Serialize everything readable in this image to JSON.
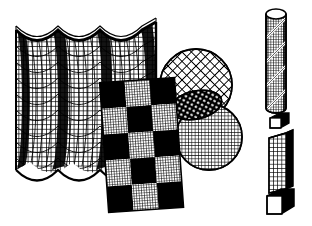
{
  "figure": {
    "background_color": "#ffffff",
    "ink_color": "#000000",
    "width": 312,
    "height": 226,
    "style": "black-and-white line art, halftone mesh textures"
  },
  "objects": [
    {
      "id": "wavy-curtain",
      "label": "Wavy curtain surface with square grid texture",
      "texture": "orthogonal-grid",
      "folds": 3,
      "bounds": {
        "x": 14,
        "y": 18,
        "w": 144,
        "h": 168
      },
      "fill": "#ffffff",
      "stroke": "#000000"
    },
    {
      "id": "checkerboard-plane",
      "label": "Tilted checkerboard plane",
      "texture": "checker-with-grid",
      "rows": 5,
      "cols": 3,
      "rotation_deg": -4,
      "bounds": {
        "x": 104,
        "y": 78,
        "w": 76,
        "h": 132
      },
      "dark_color": "#000000",
      "light_color": "#ffffff"
    },
    {
      "id": "upper-sphere",
      "label": "Sphere with diagonal crosshatch mesh",
      "texture": "diagonal-crosshatch",
      "center": {
        "x": 196,
        "y": 85
      },
      "radius": 36
    },
    {
      "id": "lower-sphere",
      "label": "Sphere with fine square grid",
      "texture": "orthogonal-grid-fine",
      "center": {
        "x": 209,
        "y": 137
      },
      "radius": 33
    },
    {
      "id": "small-ellipse",
      "label": "Small tilted ellipse with dotted mesh",
      "texture": "dotted-mesh",
      "center": {
        "x": 196,
        "y": 105
      },
      "rx": 26,
      "ry": 14,
      "rotation_deg": -12
    },
    {
      "id": "spiral-cylinder",
      "label": "Tall cylinder with helical stripe and grid texture",
      "texture": "grid-with-helix",
      "bounds": {
        "x": 266,
        "y": 8,
        "w": 20,
        "h": 106
      },
      "helix_turns": 4
    },
    {
      "id": "small-cube",
      "label": "Small white cube with black shading",
      "bounds": {
        "x": 270,
        "y": 113,
        "w": 18,
        "h": 15
      }
    },
    {
      "id": "gridded-column",
      "label": "Tall gridded rectangular column",
      "texture": "orthogonal-grid",
      "bounds": {
        "x": 268,
        "y": 131,
        "w": 22,
        "h": 62
      }
    },
    {
      "id": "pedestal-cube",
      "label": "White pedestal cube with black shaded faces",
      "bounds": {
        "x": 266,
        "y": 188,
        "w": 26,
        "h": 26
      }
    }
  ]
}
